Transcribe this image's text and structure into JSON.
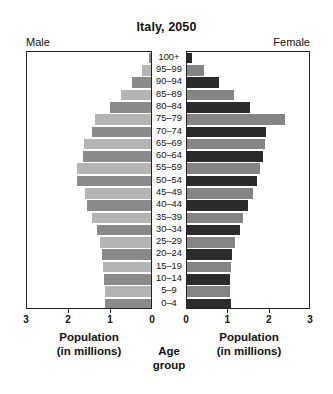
{
  "chart_data": {
    "type": "bar",
    "subtype": "population-pyramid",
    "title": "Italy, 2050",
    "xlabel": "Population (in millions)",
    "ylabel": "Age group",
    "grid": false,
    "legend": false,
    "xlim_left": [
      3,
      0
    ],
    "xlim_right": [
      0,
      3
    ],
    "x_ticks_left": [
      "3",
      "2",
      "1",
      "0"
    ],
    "x_ticks_right": [
      "0",
      "1",
      "2",
      "3"
    ],
    "categories": [
      "100+",
      "95–99",
      "90–94",
      "85–89",
      "80–84",
      "75–79",
      "70–74",
      "65–69",
      "60–64",
      "55–59",
      "50–54",
      "45–49",
      "40–44",
      "35–39",
      "30–34",
      "25–29",
      "20–24",
      "15–19",
      "10–14",
      "5–9",
      "0–4"
    ],
    "series": [
      {
        "name": "Male",
        "side": "left",
        "values": [
          0.05,
          0.22,
          0.45,
          0.72,
          1.0,
          1.35,
          1.42,
          1.62,
          1.64,
          1.78,
          1.78,
          1.6,
          1.55,
          1.43,
          1.3,
          1.24,
          1.18,
          1.15,
          1.13,
          1.12,
          1.12
        ]
      },
      {
        "name": "Female",
        "side": "right",
        "values": [
          0.12,
          0.42,
          0.78,
          1.16,
          1.55,
          2.4,
          1.95,
          1.92,
          1.88,
          1.8,
          1.72,
          1.62,
          1.5,
          1.38,
          1.3,
          1.18,
          1.1,
          1.08,
          1.06,
          1.05,
          1.08
        ]
      }
    ]
  },
  "header": {
    "title": "Italy, 2050",
    "male_label": "Male",
    "female_label": "Female"
  },
  "axes": {
    "left_caption_line1": "Population",
    "left_caption_line2": "(in millions)",
    "right_caption_line1": "Population",
    "right_caption_line2": "(in millions)",
    "center_caption_line1": "Age",
    "center_caption_line2": "group"
  },
  "colors": {
    "male_light": "#b4b4b4",
    "male_dark": "#8a8a8a",
    "female_light": "#848484",
    "female_dark": "#2b2b2b",
    "axis": "#222222",
    "background": "#ffffff",
    "text": "#111111"
  }
}
